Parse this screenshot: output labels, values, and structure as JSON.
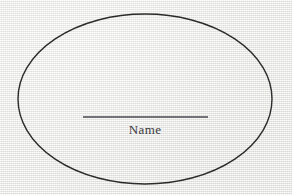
{
  "canvas": {
    "width": 292,
    "height": 195,
    "background_color": "#f0f0ee",
    "description": "scanned-paper"
  },
  "diagram": {
    "shape": {
      "icon": "ellipse-outline-icon",
      "type": "ellipse",
      "center_x": 145,
      "center_y": 99,
      "radius_x": 127,
      "radius_y": 85,
      "stroke_color": "#2b2b2b",
      "stroke_width": 1.4,
      "fill": "none"
    },
    "signature_line": {
      "icon": "horizontal-rule-icon",
      "type": "line",
      "x1": 83,
      "x2": 208,
      "y": 117,
      "stroke_color": "#4a4a50",
      "stroke_width": 1.3
    },
    "caption": {
      "text": "Name",
      "x": 145,
      "y": 134,
      "color": "#3a3a3e",
      "font_size": 13,
      "align": "center"
    }
  }
}
